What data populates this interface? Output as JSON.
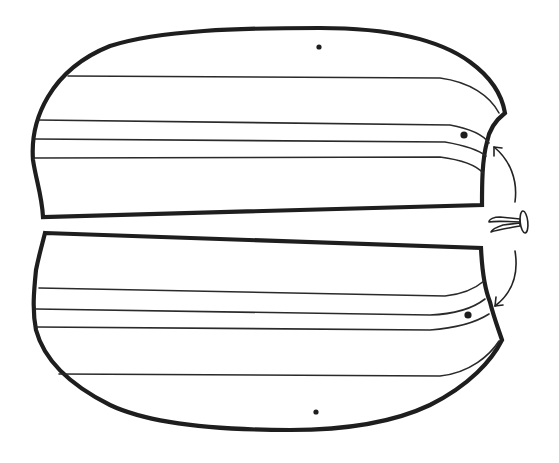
{
  "figure": {
    "description": "Two pattern panel pieces with fold lines and punched holes; a split-pin paper fastener with curved arrows indicates the holes on each panel are joined with the fastener.",
    "background_color": "#ffffff",
    "line_color": "#1e1e1e"
  },
  "pieces": [
    {
      "id": "top-panel",
      "fold_line_count": 4,
      "center_dot": {
        "x": 319,
        "y": 47
      },
      "hole": {
        "x": 464,
        "y": 135
      }
    },
    {
      "id": "bottom-panel",
      "fold_line_count": 4,
      "center_dot": {
        "x": 316,
        "y": 412
      },
      "hole": {
        "x": 468,
        "y": 315
      }
    }
  ],
  "fastener": {
    "type": "split-pin-brad",
    "icon": "brad-fastener-icon",
    "position": {
      "x": 505,
      "y": 222
    }
  },
  "arrows": [
    {
      "id": "arrow-to-top-hole",
      "direction": "up-left"
    },
    {
      "id": "arrow-to-bottom-hole",
      "direction": "down-left"
    }
  ]
}
